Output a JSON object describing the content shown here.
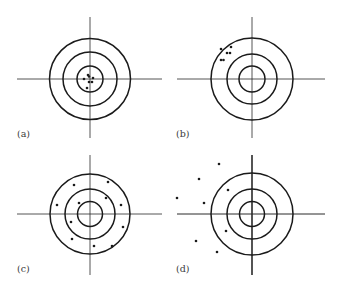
{
  "figure": {
    "colors": {
      "line": "#2a2a2a",
      "ring": "#1a1a1a",
      "dot": "#1a1a1a",
      "background": "#ffffff"
    },
    "panels": [
      {
        "id": "a",
        "label": "(a)",
        "center": [
          90,
          79
        ],
        "rings": [
          13,
          27,
          40.5
        ],
        "crosshair": {
          "h": [
            17,
            162
          ],
          "v": [
            17,
            138
          ]
        },
        "label_pos": [
          17,
          137
        ],
        "dots": [
          [
            88,
            75
          ],
          [
            89,
            76.5
          ],
          [
            84,
            79
          ],
          [
            93,
            78
          ],
          [
            89,
            82
          ],
          [
            92,
            82
          ],
          [
            87,
            88
          ]
        ]
      },
      {
        "id": "b",
        "label": "(b)",
        "center": [
          252,
          79
        ],
        "rings": [
          13,
          25,
          41
        ],
        "crosshair": {
          "h": [
            177,
            325
          ],
          "v": [
            17,
            138
          ]
        },
        "label_pos": [
          176,
          137
        ],
        "dots": [
          [
            231,
            47
          ],
          [
            221,
            49
          ],
          [
            227,
            53
          ],
          [
            230,
            53
          ],
          [
            221,
            60
          ],
          [
            223.5,
            60
          ]
        ]
      },
      {
        "id": "c",
        "label": "(c)",
        "center": [
          90,
          214
        ],
        "rings": [
          12.5,
          25,
          40
        ],
        "crosshair": {
          "h": [
            17,
            162
          ],
          "v": [
            155,
            275
          ]
        },
        "label_pos": [
          17,
          272
        ],
        "dots": [
          [
            108,
            182
          ],
          [
            74,
            185
          ],
          [
            106,
            198
          ],
          [
            79,
            203
          ],
          [
            57,
            205
          ],
          [
            121,
            205
          ],
          [
            71,
            222
          ],
          [
            123,
            227
          ],
          [
            72,
            239
          ],
          [
            94,
            246
          ],
          [
            112,
            246
          ]
        ]
      },
      {
        "id": "d",
        "label": "(d)",
        "center": [
          252,
          214
        ],
        "rings": [
          12.5,
          25,
          41
        ],
        "crosshair": {
          "h": [
            177,
            325
          ],
          "v": [
            155,
            275
          ]
        },
        "label_pos": [
          176,
          272
        ],
        "dots": [
          [
            219,
            164
          ],
          [
            199,
            179
          ],
          [
            228,
            190
          ],
          [
            177,
            198
          ],
          [
            204,
            203
          ],
          [
            226,
            231
          ],
          [
            196,
            241
          ],
          [
            217,
            252
          ]
        ]
      }
    ]
  }
}
